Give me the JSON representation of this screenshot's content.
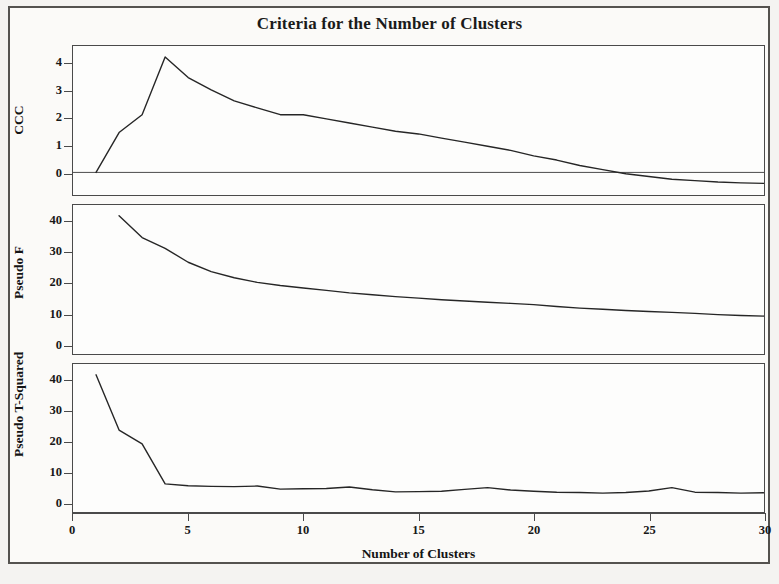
{
  "chart_data": {
    "type": "line",
    "title": "Criteria for the Number of Clusters",
    "xlabel": "Number of Clusters",
    "x": [
      1,
      2,
      3,
      4,
      5,
      6,
      7,
      8,
      9,
      10,
      11,
      12,
      13,
      14,
      15,
      16,
      17,
      18,
      19,
      20,
      21,
      22,
      23,
      24,
      25,
      26,
      27,
      28,
      29,
      30
    ],
    "xlim": [
      0,
      30
    ],
    "xticks": [
      "0",
      "5",
      "10",
      "15",
      "20",
      "25",
      "30"
    ],
    "xtick_values": [
      0,
      5,
      10,
      15,
      20,
      25,
      30
    ],
    "grid": false,
    "legend": "none",
    "panels": [
      {
        "name": "ccc",
        "ylabel": "CCC",
        "ylim": [
          -0.75,
          4.6
        ],
        "yticks": [
          "0",
          "1",
          "2",
          "3",
          "4"
        ],
        "ytick_values": [
          0,
          1,
          2,
          3,
          4
        ],
        "reference_line": 0,
        "values": [
          0.0,
          1.45,
          2.1,
          4.2,
          3.45,
          3.0,
          2.6,
          2.35,
          2.1,
          2.1,
          1.95,
          1.8,
          1.65,
          1.5,
          1.4,
          1.25,
          1.1,
          0.95,
          0.8,
          0.6,
          0.45,
          0.25,
          0.1,
          -0.05,
          -0.15,
          -0.25,
          -0.3,
          -0.35,
          -0.38,
          -0.4
        ]
      },
      {
        "name": "pseudo_f",
        "ylabel": "Pseudo F",
        "ylim": [
          -2.5,
          45
        ],
        "yticks": [
          "0",
          "10",
          "20",
          "30",
          "40"
        ],
        "ytick_values": [
          0,
          10,
          20,
          30,
          40
        ],
        "values": [
          null,
          41.5,
          34.5,
          31.0,
          26.5,
          23.5,
          21.5,
          20.0,
          19.0,
          18.2,
          17.4,
          16.6,
          16.0,
          15.4,
          14.9,
          14.4,
          14.0,
          13.6,
          13.2,
          12.8,
          12.2,
          11.7,
          11.3,
          10.9,
          10.6,
          10.3,
          10.0,
          9.6,
          9.3,
          9.1
        ]
      },
      {
        "name": "pseudo_t_squared",
        "ylabel": "Pseudo T-Squared",
        "ylim": [
          -2.5,
          45
        ],
        "yticks": [
          "0",
          "10",
          "20",
          "30",
          "40"
        ],
        "ytick_values": [
          0,
          10,
          20,
          30,
          40
        ],
        "values": [
          41.5,
          23.5,
          19.0,
          6.0,
          5.4,
          5.2,
          5.1,
          5.3,
          4.3,
          4.4,
          4.5,
          5.0,
          4.1,
          3.4,
          3.5,
          3.6,
          4.2,
          4.8,
          4.0,
          3.6,
          3.3,
          3.2,
          3.0,
          3.2,
          3.7,
          4.8,
          3.3,
          3.2,
          3.0,
          3.1
        ]
      }
    ]
  },
  "colors": {
    "line": "#262626",
    "axis": "#4a4a4a",
    "frame": "#54524f",
    "background": "#fbfaf8",
    "text": "#171717"
  }
}
